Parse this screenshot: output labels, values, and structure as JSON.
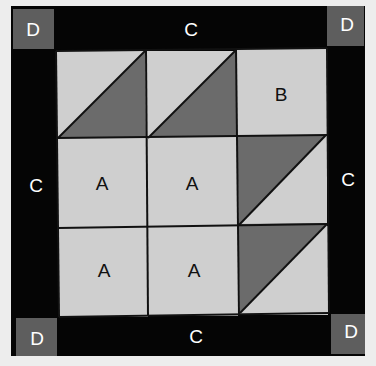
{
  "colors": {
    "background": "#ededed",
    "border_black": "#050505",
    "corner_gray": "#5e5e5e",
    "light_fabric": "#cfcfcf",
    "dark_fabric": "#6b6b6b",
    "seam": "#111111",
    "label_on_dark": "#ffffff",
    "label_on_light": "#111111"
  },
  "corners": [
    {
      "label": "D",
      "position": "top-left"
    },
    {
      "label": "D",
      "position": "top-right"
    },
    {
      "label": "D",
      "position": "bottom-left"
    },
    {
      "label": "D",
      "position": "bottom-right"
    }
  ],
  "borders": {
    "top": "C",
    "left": "C",
    "right": "C",
    "bottom": "C"
  },
  "grid": {
    "rows": [
      [
        {
          "type": "half-square-triangle",
          "dark": "lower-right",
          "label": ""
        },
        {
          "type": "half-square-triangle",
          "dark": "lower-right",
          "label": ""
        },
        {
          "type": "square",
          "label": "B"
        }
      ],
      [
        {
          "type": "square",
          "label": "A"
        },
        {
          "type": "square",
          "label": "A"
        },
        {
          "type": "half-square-triangle",
          "dark": "upper-left",
          "label": ""
        }
      ],
      [
        {
          "type": "square",
          "label": "A"
        },
        {
          "type": "square",
          "label": "A"
        },
        {
          "type": "half-square-triangle",
          "dark": "upper-left",
          "label": ""
        }
      ]
    ]
  }
}
